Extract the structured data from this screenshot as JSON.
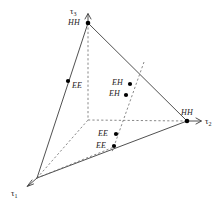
{
  "figure": {
    "type": "3d-axis-diagram",
    "background_color": "#ffffff",
    "line_color": "#3c3c3c",
    "point_color": "#000000",
    "text_color": "#1a1a1a"
  },
  "axes": [
    {
      "id": "tau1",
      "label": "τ",
      "subscript": "1",
      "direction": "lower-left",
      "x": 14,
      "y": 191
    },
    {
      "id": "tau2",
      "label": "τ",
      "subscript": "2",
      "direction": "right",
      "x": 207,
      "y": 121
    },
    {
      "id": "tau3",
      "label": "τ",
      "subscript": "3",
      "direction": "up",
      "x": 72,
      "y": 9
    }
  ],
  "vertices": [
    {
      "id": "apex-top",
      "label": "HH",
      "x": 88,
      "y": 23,
      "label_x": 68,
      "label_y": 19
    },
    {
      "id": "vertex-right",
      "label": "HH",
      "x": 187,
      "y": 121,
      "label_x": 182,
      "label_y": 110
    },
    {
      "id": "vertex-origin",
      "label": "",
      "x": 37,
      "y": 178,
      "label_x": 0,
      "label_y": 0
    }
  ],
  "points": [
    {
      "id": "ee-left-edge",
      "label": "EE",
      "x": 68,
      "y": 81,
      "label_x": 71,
      "label_y": 84
    },
    {
      "id": "eh-upper",
      "label": "EH",
      "x": 130,
      "y": 84,
      "label_x": 113,
      "label_y": 80
    },
    {
      "id": "eh-lower",
      "label": "EH",
      "x": 126,
      "y": 94,
      "label_x": 110,
      "label_y": 90
    },
    {
      "id": "ee-upper-lower",
      "label": "EE",
      "x": 116,
      "y": 134,
      "label_x": 99,
      "label_y": 131
    },
    {
      "id": "ee-lower-lower",
      "label": "EE",
      "x": 114,
      "y": 145,
      "label_x": 97,
      "label_y": 142
    }
  ],
  "solid_edges": [
    {
      "id": "edge-apex-to-origin",
      "from": [
        88,
        23
      ],
      "to": [
        37,
        178
      ]
    },
    {
      "id": "edge-apex-to-right",
      "from": [
        88,
        23
      ],
      "to": [
        187,
        121
      ]
    },
    {
      "id": "edge-origin-to-right",
      "from": [
        37,
        178
      ],
      "to": [
        187,
        121
      ]
    }
  ],
  "dashed_lines": [
    {
      "id": "vertical-drop-from-apex",
      "from": [
        88,
        23
      ],
      "to": [
        88,
        120
      ]
    },
    {
      "id": "horizontal-to-right-vertex",
      "from": [
        88,
        120
      ],
      "to": [
        187,
        121
      ]
    },
    {
      "id": "origin-to-inner-corner",
      "from": [
        37,
        178
      ],
      "to": [
        88,
        120
      ]
    },
    {
      "id": "origin-to-ee-points",
      "from": [
        37,
        178
      ],
      "to": [
        114,
        146
      ]
    },
    {
      "id": "slanted-through-eh-ee",
      "from": [
        144,
        62
      ],
      "to": [
        112,
        152
      ]
    }
  ],
  "axis_arrows": [
    {
      "id": "arrow-tau3",
      "tip": [
        88,
        14
      ],
      "direction": "up"
    },
    {
      "id": "arrow-tau2",
      "tip": [
        200,
        121
      ],
      "direction": "right"
    },
    {
      "id": "arrow-tau1",
      "tip": [
        28,
        185
      ],
      "direction": "lower-left"
    }
  ]
}
